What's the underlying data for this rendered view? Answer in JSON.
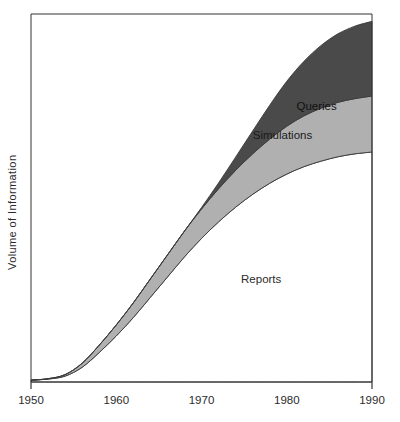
{
  "chart_data": {
    "type": "area",
    "stacked": true,
    "title": "",
    "subtitle": "",
    "xlabel": "",
    "ylabel": "Volume  of  Information",
    "x": [
      1950,
      1952,
      1954,
      1956,
      1958,
      1960,
      1962,
      1964,
      1966,
      1968,
      1970,
      1972,
      1974,
      1976,
      1978,
      1980,
      1982,
      1984,
      1986,
      1988,
      1990
    ],
    "xlim": [
      1950,
      1990
    ],
    "ylim": [
      0,
      100
    ],
    "xticks": [
      1950,
      1960,
      1970,
      1980,
      1990
    ],
    "xtick_labels": [
      "1950",
      "1960",
      "1970",
      "1980",
      "1990"
    ],
    "yticks": [],
    "ytick_labels": [],
    "grid": false,
    "legend_position": "inline-annotations",
    "series": [
      {
        "name": "Reports",
        "fill_color": "#ffffff",
        "label_text": "Reports",
        "values": [
          0.5,
          0.8,
          1.6,
          4.0,
          8.0,
          12.5,
          17.5,
          23.0,
          28.5,
          34.0,
          39.0,
          43.5,
          47.5,
          51.0,
          54.0,
          56.5,
          58.5,
          60.0,
          61.2,
          62.0,
          62.5
        ]
      },
      {
        "name": "Simulations",
        "fill_color": "#b0b0b0",
        "label_text": "Simulations",
        "values": [
          0.0,
          0.1,
          0.4,
          1.1,
          2.0,
          3.0,
          4.0,
          5.0,
          6.0,
          7.0,
          8.0,
          9.0,
          10.0,
          11.0,
          12.0,
          13.0,
          13.8,
          14.4,
          14.8,
          15.0,
          15.2
        ]
      },
      {
        "name": "Queries",
        "fill_color": "#4a4a4a",
        "label_text": "Queries",
        "values": [
          0.0,
          0.0,
          0.0,
          0.0,
          0.0,
          0.0,
          0.0,
          0.0,
          0.0,
          0.0,
          0.4,
          1.6,
          3.6,
          6.2,
          9.2,
          12.2,
          14.8,
          17.0,
          18.6,
          19.7,
          20.3
        ]
      }
    ],
    "annotations": [
      {
        "text": "Queries",
        "x": 1983.5,
        "y": 74.0
      },
      {
        "text": "Simulations",
        "x": 1979.5,
        "y": 66.0
      },
      {
        "text": "Reports",
        "x": 1977.0,
        "y": 27.0
      }
    ],
    "frame": {
      "color": "#333333",
      "width": 1
    }
  },
  "axes": {
    "y_title": "Volume  of  Information",
    "x_tick_labels": [
      "1950",
      "1960",
      "1970",
      "1980",
      "1990"
    ]
  },
  "colors": {
    "queries": "#4a4a4a",
    "simulations": "#b0b0b0",
    "reports": "#ffffff",
    "frame": "#333333",
    "text": "#2b2b2b",
    "background": "#ffffff"
  }
}
